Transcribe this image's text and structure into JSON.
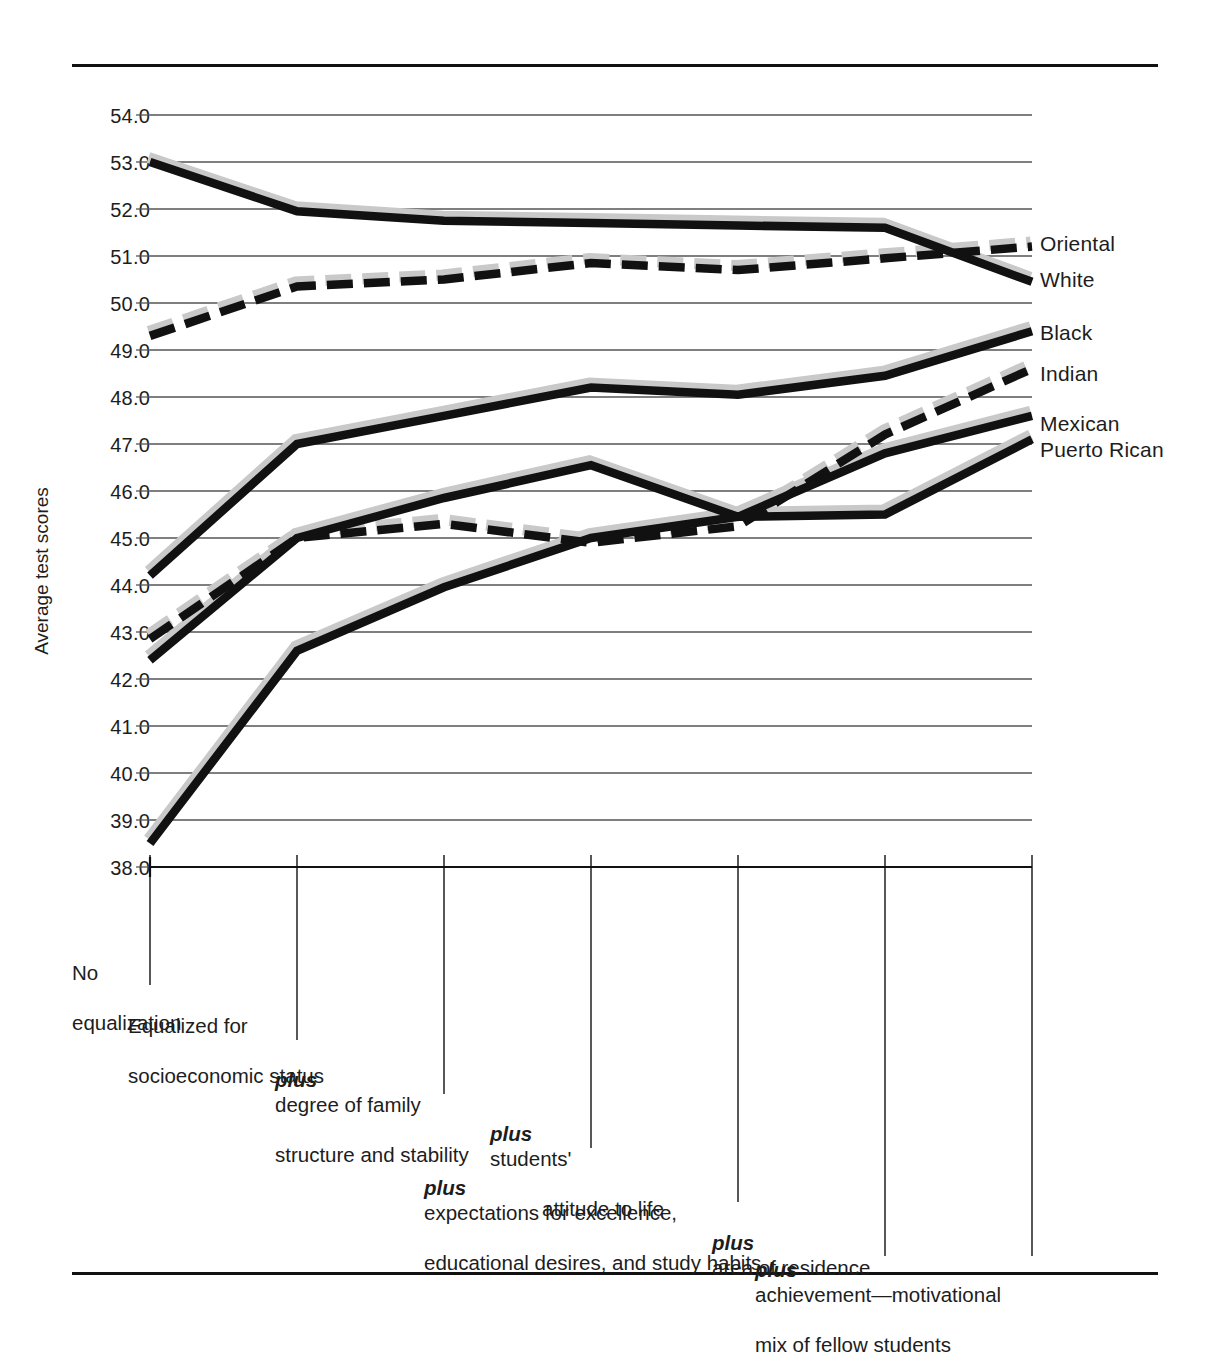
{
  "chart_data": {
    "type": "line",
    "title": "",
    "xlabel": "",
    "ylabel": "Average test scores",
    "ylim": [
      38.0,
      54.0
    ],
    "grid": true,
    "legend_position": "right-endpoints",
    "ytick_labels": [
      "54.0",
      "53.0",
      "52.0",
      "51.0",
      "50.0",
      "49.0",
      "48.0",
      "47.0",
      "46.0",
      "45.0",
      "44.0",
      "43.0",
      "42.0",
      "41.0",
      "40.0",
      "39.0",
      "38.0"
    ],
    "ytick_values": [
      54,
      53,
      52,
      51,
      50,
      49,
      48,
      47,
      46,
      45,
      44,
      43,
      42,
      41,
      40,
      39,
      38
    ],
    "categories": [
      "No equalization",
      "Equalized for socioeconomic status",
      "plus degree of family structure and stability",
      "plus students' attitude to life",
      "plus expectations for excellence, educational desires, and study habits",
      "plus area of residence",
      "plus achievement—motivational mix of fellow students"
    ],
    "series": [
      {
        "name": "Oriental",
        "style": "dashed",
        "values": [
          49.3,
          50.35,
          50.5,
          50.85,
          50.7,
          50.95,
          51.2
        ]
      },
      {
        "name": "White",
        "style": "solid",
        "values": [
          53.0,
          51.95,
          51.75,
          51.7,
          51.65,
          51.6,
          50.45
        ]
      },
      {
        "name": "Black",
        "style": "solid",
        "values": [
          44.2,
          47.0,
          47.6,
          48.2,
          48.05,
          48.45,
          49.4
        ]
      },
      {
        "name": "Indian",
        "style": "dashed",
        "values": [
          42.85,
          45.0,
          45.3,
          44.9,
          45.25,
          47.2,
          48.6
        ]
      },
      {
        "name": "Mexican",
        "style": "solid",
        "values": [
          42.4,
          45.0,
          45.85,
          46.55,
          45.45,
          46.8,
          47.6
        ]
      },
      {
        "name": "Puerto Rican",
        "style": "solid",
        "values": [
          38.5,
          42.6,
          43.95,
          45.0,
          45.45,
          45.5,
          47.1
        ]
      }
    ]
  },
  "axis": {
    "y_label": "Average test scores",
    "ticks": [
      {
        "label": "54.0"
      },
      {
        "label": "53.0"
      },
      {
        "label": "52.0"
      },
      {
        "label": "51.0"
      },
      {
        "label": "50.0"
      },
      {
        "label": "49.0"
      },
      {
        "label": "48.0"
      },
      {
        "label": "47.0"
      },
      {
        "label": "46.0"
      },
      {
        "label": "45.0"
      },
      {
        "label": "44.0"
      },
      {
        "label": "43.0"
      },
      {
        "label": "42.0"
      },
      {
        "label": "41.0"
      },
      {
        "label": "40.0"
      },
      {
        "label": "39.0"
      },
      {
        "label": "38.0"
      }
    ]
  },
  "legend": {
    "entries": [
      {
        "label": "Oriental"
      },
      {
        "label": "White"
      },
      {
        "label": "Black"
      },
      {
        "label": "Indian"
      },
      {
        "label": "Mexican"
      },
      {
        "label": "Puerto Rican"
      }
    ]
  },
  "xcategories": [
    {
      "line1": "No",
      "line2": "equalization",
      "italic": ""
    },
    {
      "line1": "Equalized for",
      "line2": "socioeconomic status",
      "italic": ""
    },
    {
      "line1": "degree of family",
      "line2": "structure and stability",
      "italic": "plus"
    },
    {
      "line1": "students'",
      "line2": "attitude to life",
      "italic": "plus"
    },
    {
      "line1": "expectations for excellence,",
      "line2": "educational desires, and study habits",
      "italic": "plus"
    },
    {
      "line1": "area of residence",
      "line2": "",
      "italic": "plus"
    },
    {
      "line1": "achievement—motivational",
      "line2": "mix of fellow students",
      "italic": "plus"
    }
  ],
  "colors": {
    "ink": "#111111",
    "grid": "#555555",
    "shadow": "#c9c9c9",
    "background": "#ffffff"
  }
}
